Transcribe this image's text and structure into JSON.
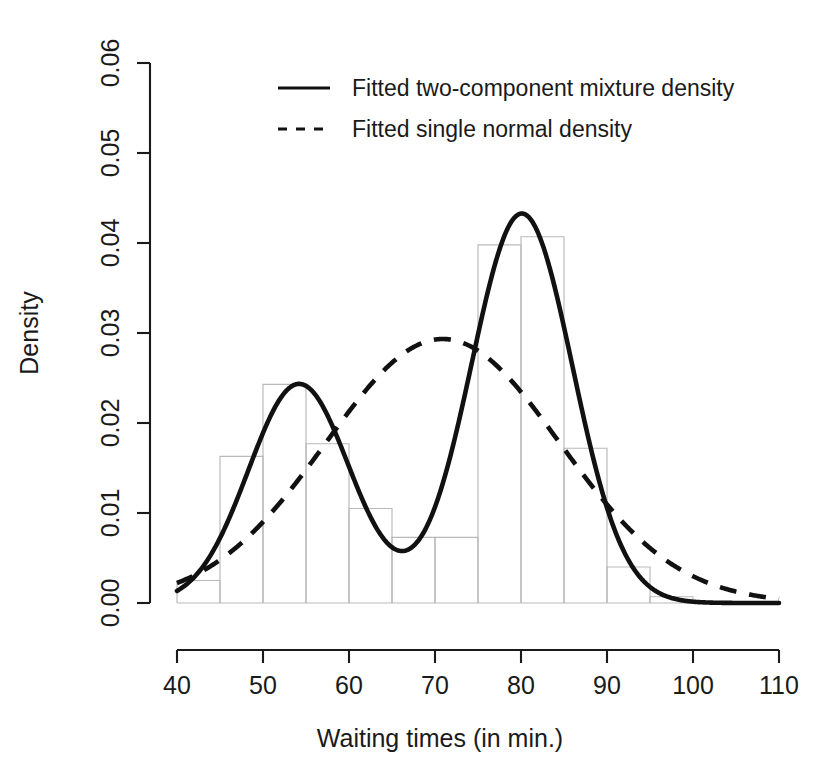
{
  "chart_data": {
    "type": "area",
    "title": "",
    "subtitle": "",
    "xlabel": "Waiting times (in min.)",
    "ylabel": "Density",
    "xlim": [
      40,
      110
    ],
    "ylim": [
      0.0,
      0.06
    ],
    "grid": false,
    "legend_position": "top-center",
    "x_ticks": [
      40,
      50,
      60,
      70,
      80,
      90,
      100,
      110
    ],
    "x_tick_labels": [
      "40",
      "50",
      "60",
      "70",
      "80",
      "90",
      "100",
      "110"
    ],
    "y_ticks": [
      0.0,
      0.01,
      0.02,
      0.03,
      0.04,
      0.05,
      0.06
    ],
    "y_tick_labels": [
      "0.00",
      "0.01",
      "0.02",
      "0.03",
      "0.04",
      "0.05",
      "0.06"
    ],
    "histogram": {
      "name": "Waiting times histogram",
      "bin_width": 5,
      "bin_edges": [
        40,
        45,
        50,
        55,
        60,
        65,
        70,
        75,
        80,
        85,
        90,
        95,
        100
      ],
      "densities": [
        0.0025,
        0.0163,
        0.0243,
        0.0177,
        0.0105,
        0.0073,
        0.0073,
        0.0398,
        0.0407,
        0.0172,
        0.004,
        0.0007
      ],
      "fill": "none",
      "stroke": "#b9b9b9"
    },
    "series": [
      {
        "name": "Fitted two-component mixture density",
        "style": "solid",
        "color": "#111111",
        "model": "mixture",
        "parameters": {
          "weights": [
            0.36,
            0.64
          ],
          "means": [
            54.2,
            80.1
          ],
          "sds": [
            5.9,
            5.9
          ]
        },
        "peaks": [
          {
            "x": 54.2,
            "y": 0.0243
          },
          {
            "x": 80.1,
            "y": 0.0435
          }
        ],
        "valley": {
          "x": 66.0,
          "y": 0.0067
        }
      },
      {
        "name": "Fitted single normal density",
        "style": "dashed",
        "color": "#111111",
        "model": "normal",
        "parameters": {
          "mean": 70.9,
          "sd": 13.6
        },
        "peaks": [
          {
            "x": 70.9,
            "y": 0.0292
          }
        ]
      }
    ]
  },
  "legend": {
    "entries": [
      {
        "label": "Fitted two-component mixture density",
        "style": "solid"
      },
      {
        "label": "Fitted single normal density",
        "style": "dashed"
      }
    ]
  },
  "axes": {
    "x_title": "Waiting times (in min.)",
    "y_title": "Density"
  }
}
